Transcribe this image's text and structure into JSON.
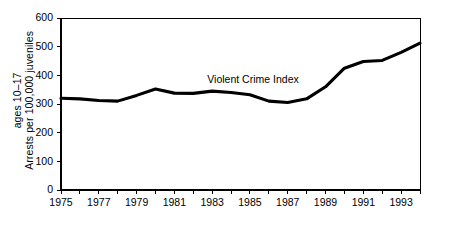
{
  "chart_data": {
    "type": "line",
    "title": "",
    "xlabel": "",
    "ylabel_lines": [
      "Arrests per 100,000 juveniles",
      "ages 10–17"
    ],
    "ylabel": "Arrests per 100,000 juveniles ages 10–17",
    "grid": false,
    "legend_position": "inline-annotation",
    "line_color": "#000000",
    "series": [
      {
        "name": "Violent Crime Index",
        "annotation": "Violent Crime Index",
        "x": [
          1975,
          1976,
          1977,
          1978,
          1979,
          1980,
          1981,
          1982,
          1983,
          1984,
          1985,
          1986,
          1987,
          1988,
          1989,
          1990,
          1991,
          1992,
          1993,
          1994
        ],
        "values": [
          320,
          318,
          312,
          310,
          330,
          352,
          338,
          337,
          345,
          340,
          332,
          310,
          305,
          318,
          360,
          425,
          448,
          452,
          480,
          512
        ]
      }
    ],
    "xlim": [
      1975,
      1994
    ],
    "ylim": [
      0,
      600
    ],
    "yticks": [
      0,
      100,
      200,
      300,
      400,
      500,
      600
    ],
    "ytick_labels": [
      "0",
      "100",
      "200",
      "300",
      "400",
      "500",
      "600"
    ],
    "xticks": [
      1975,
      1976,
      1977,
      1978,
      1979,
      1980,
      1981,
      1982,
      1983,
      1984,
      1985,
      1986,
      1987,
      1988,
      1989,
      1990,
      1991,
      1992,
      1993,
      1994
    ],
    "xtick_labels_shown": [
      "1975",
      "1977",
      "1979",
      "1981",
      "1983",
      "1985",
      "1987",
      "1989",
      "1991",
      "1993"
    ],
    "xtick_label_years": [
      1975,
      1977,
      1979,
      1981,
      1983,
      1985,
      1987,
      1989,
      1991,
      1993
    ]
  }
}
